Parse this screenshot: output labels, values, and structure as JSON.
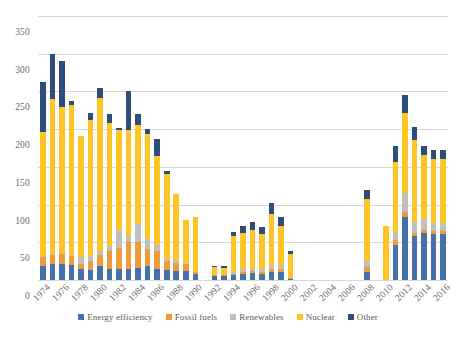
{
  "chart_data": {
    "type": "bar",
    "subtype": "stacked-column",
    "title": "",
    "xlabel": "",
    "ylabel": "",
    "ylim": [
      0,
      350
    ],
    "ytick_step": 50,
    "ytick_labels": [
      "0",
      "50",
      "100",
      "150",
      "200",
      "250",
      "300",
      "350"
    ],
    "grid": true,
    "grid_axis": "y",
    "legend_position": "bottom",
    "x_tick_labels": [
      "1974",
      "1976",
      "1978",
      "1980",
      "1982",
      "1984",
      "1986",
      "1988",
      "1990",
      "1992",
      "1994",
      "1996",
      "1998",
      "2000",
      "2002",
      "2004",
      "2006",
      "2008",
      "2010",
      "2012",
      "2014",
      "2016"
    ],
    "x_tick_step": 2,
    "categories": [
      "1974",
      "1975",
      "1976",
      "1977",
      "1978",
      "1979",
      "1980",
      "1981",
      "1982",
      "1983",
      "1984",
      "1985",
      "1986",
      "1987",
      "1988",
      "1989",
      "1990",
      "1991",
      "1992",
      "1993",
      "1994",
      "1995",
      "1996",
      "1997",
      "1998",
      "1999",
      "2000",
      "2001",
      "2002",
      "2003",
      "2004",
      "2005",
      "2006",
      "2007",
      "2008",
      "2009",
      "2010",
      "2011",
      "2012",
      "2013",
      "2014",
      "2015",
      "2016"
    ],
    "series": [
      {
        "name": "Energy efficiency",
        "color": "#4472a8",
        "values": [
          19,
          21,
          21,
          20,
          15,
          13,
          18,
          15,
          14,
          15,
          16,
          19,
          14,
          13,
          12,
          12,
          8,
          0,
          5,
          5,
          6,
          8,
          9,
          8,
          11,
          11,
          2,
          0,
          0,
          0,
          0,
          0,
          0,
          0,
          10,
          0,
          0,
          47,
          84,
          58,
          62,
          61,
          61
        ]
      },
      {
        "name": "Fossil fuels",
        "color": "#ed9b3b",
        "values": [
          12,
          12,
          14,
          12,
          6,
          12,
          15,
          23,
          29,
          35,
          35,
          22,
          24,
          12,
          11,
          9,
          2,
          0,
          1,
          1,
          2,
          3,
          3,
          3,
          4,
          4,
          1,
          0,
          0,
          0,
          0,
          0,
          0,
          0,
          7,
          0,
          0,
          6,
          6,
          4,
          4,
          4,
          4
        ]
      },
      {
        "name": "Renewables",
        "color": "#bfbfbf",
        "values": [
          1,
          1,
          1,
          1,
          10,
          7,
          6,
          7,
          24,
          9,
          23,
          14,
          8,
          3,
          3,
          2,
          1,
          0,
          1,
          1,
          2,
          3,
          4,
          4,
          5,
          5,
          1,
          0,
          0,
          0,
          0,
          0,
          0,
          0,
          8,
          0,
          0,
          11,
          26,
          15,
          15,
          11,
          11
        ]
      },
      {
        "name": "Nuclear",
        "color": "#ffc425",
        "values": [
          164,
          206,
          194,
          199,
          160,
          180,
          203,
          163,
          132,
          140,
          132,
          139,
          119,
          112,
          88,
          57,
          72,
          0,
          10,
          9,
          48,
          49,
          50,
          46,
          67,
          52,
          30,
          0,
          0,
          0,
          0,
          0,
          0,
          0,
          83,
          0,
          71,
          92,
          105,
          108,
          85,
          85,
          85
        ]
      },
      {
        "name": "Other",
        "color": "#2e4d7b",
        "values": [
          67,
          60,
          60,
          6,
          0,
          9,
          12,
          12,
          2,
          52,
          14,
          6,
          22,
          5,
          0,
          0,
          0,
          0,
          2,
          2,
          6,
          8,
          11,
          9,
          15,
          11,
          5,
          0,
          0,
          0,
          0,
          0,
          0,
          0,
          12,
          0,
          0,
          22,
          24,
          18,
          12,
          12,
          12
        ]
      }
    ]
  },
  "legend": {
    "items": [
      {
        "label": "Energy efficiency",
        "color": "#4472a8"
      },
      {
        "label": "Fossil fuels",
        "color": "#ed9b3b"
      },
      {
        "label": "Renewables",
        "color": "#bfbfbf"
      },
      {
        "label": "Nuclear",
        "color": "#ffc425"
      },
      {
        "label": "Other",
        "color": "#2e4d7b"
      }
    ]
  }
}
